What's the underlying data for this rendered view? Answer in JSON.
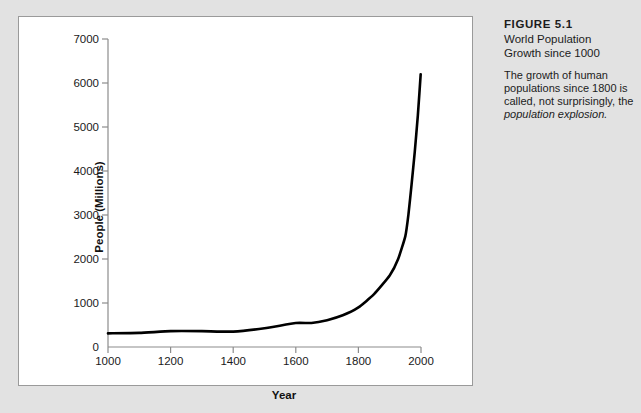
{
  "figure": {
    "number": "FIGURE 5.1",
    "title": "World Population\nGrowth since 1000",
    "title_line1": "World Population",
    "title_line2": "Growth since 1000",
    "caption_text": "The growth of human populations since 1800 is called, not surprisingly, the ",
    "caption_italic": "population explosion."
  },
  "chart_data": {
    "type": "line",
    "title": "World Population Growth since 1000",
    "xlabel": "Year",
    "ylabel": "People (Millions)",
    "xlim": [
      1000,
      2000
    ],
    "ylim": [
      0,
      7000
    ],
    "xticks": [
      1000,
      1200,
      1400,
      1600,
      1800,
      2000
    ],
    "xtick_labels": [
      "1000",
      "1200",
      "1400",
      "1600",
      "1800",
      "2000"
    ],
    "yticks": [
      0,
      1000,
      2000,
      3000,
      4000,
      5000,
      6000,
      7000
    ],
    "ytick_labels": [
      "0",
      "1000",
      "2000",
      "3000",
      "4000",
      "5000",
      "6000",
      "7000"
    ],
    "grid": false,
    "legend": false,
    "line_color": "#000000",
    "line_width": 2.6,
    "series": [
      {
        "name": "World population",
        "x": [
          1000,
          1100,
          1200,
          1300,
          1400,
          1500,
          1600,
          1650,
          1700,
          1750,
          1800,
          1850,
          1900,
          1927,
          1950,
          1960,
          1970,
          1980,
          1990,
          1999
        ],
        "values": [
          310,
          320,
          360,
          360,
          350,
          425,
          545,
          545,
          610,
          720,
          900,
          1200,
          1625,
          2000,
          2520,
          3020,
          3700,
          4430,
          5270,
          6200
        ]
      }
    ]
  },
  "source_note": ""
}
